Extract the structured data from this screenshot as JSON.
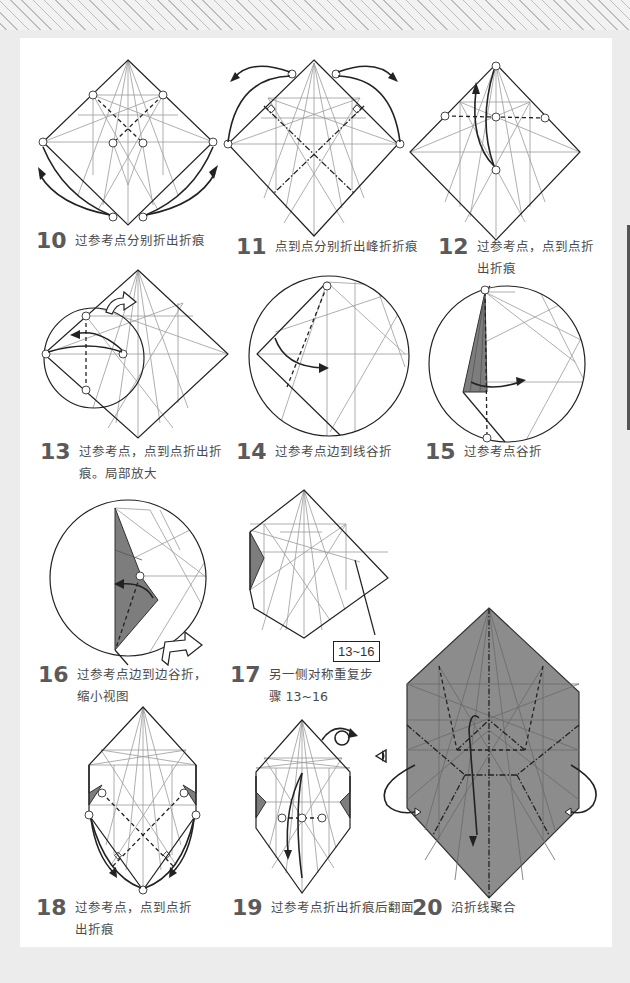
{
  "steps": [
    {
      "number": "10",
      "text_line1": "过参考点分别折出折痕",
      "text_line2": ""
    },
    {
      "number": "11",
      "text_line1": "点到点分别折出峰折折痕",
      "text_line2": ""
    },
    {
      "number": "12",
      "text_line1": "过参考点，点到点折",
      "text_line2": "出折痕"
    },
    {
      "number": "13",
      "text_line1": "过参考点，点到点折出折",
      "text_line2": "痕。局部放大"
    },
    {
      "number": "14",
      "text_line1": "过参考点边到线谷折",
      "text_line2": ""
    },
    {
      "number": "15",
      "text_line1": "过参考点谷折",
      "text_line2": ""
    },
    {
      "number": "16",
      "text_line1": "过参考点边到边谷折，",
      "text_line2": "缩小视图"
    },
    {
      "number": "17",
      "text_line1": "另一侧对称重复步",
      "text_line2": "骤 13~16"
    },
    {
      "number": "18",
      "text_line1": "过参考点，点到点折",
      "text_line2": "出折痕"
    },
    {
      "number": "19",
      "text_line1": "过参考点折出折痕后翻面",
      "text_line2": ""
    },
    {
      "number": "20",
      "text_line1": "沿折线聚合",
      "text_line2": ""
    }
  ],
  "callouts": {
    "step17_label": "13~16"
  },
  "icons": {
    "reference_point": "circle-marker",
    "fold_arrow": "curved-arrow",
    "push_arrow": "hollow-arrow",
    "turn_over": "turn-over-arrow",
    "view_direction": "eye-icon",
    "right_angle": "right-angle-marker"
  },
  "colors": {
    "paper_back": "#7d7d7d",
    "line_crease": "#9a9a9a",
    "line_edge": "#222222",
    "step_number": "#5a5a5a",
    "page_bg": "#ffffff",
    "margin_bg": "#ececec"
  }
}
